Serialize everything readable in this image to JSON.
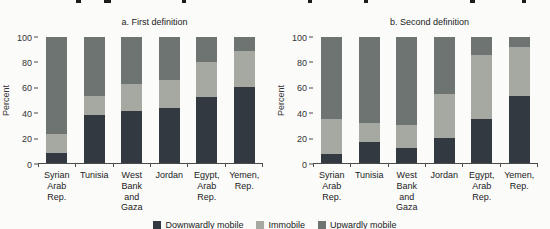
{
  "figure": {
    "background": "#fbfbfa"
  },
  "legend": {
    "items": [
      {
        "label": "Downwardly mobile",
        "color": "#323941"
      },
      {
        "label": "Immobile",
        "color": "#a5a9a2"
      },
      {
        "label": "Upwardly mobile",
        "color": "#6d7472"
      }
    ]
  },
  "chart_data": [
    {
      "type": "bar",
      "stacked": true,
      "title": "a. First definition",
      "ylabel": "Percent",
      "ylim": [
        0,
        100
      ],
      "yticks": [
        0,
        20,
        40,
        60,
        80,
        100
      ],
      "grid": false,
      "legend_position": "bottom-center-shared",
      "categories": [
        "Syrian Arab\nRep.",
        "Tunisia",
        "West Bank\nand Gaza",
        "Jordan",
        "Egypt,\nArab Rep.",
        "Yemen,\nRep."
      ],
      "series": [
        {
          "name": "Downwardly mobile",
          "color": "#323941",
          "values": [
            8,
            38,
            41,
            44,
            52,
            60
          ]
        },
        {
          "name": "Immobile",
          "color": "#a5a9a2",
          "values": [
            15,
            15,
            22,
            22,
            28,
            29
          ]
        },
        {
          "name": "Upwardly mobile",
          "color": "#6d7472",
          "values": [
            77,
            47,
            37,
            34,
            20,
            11
          ]
        }
      ]
    },
    {
      "type": "bar",
      "stacked": true,
      "title": "b. Second definition",
      "ylabel": "Percent",
      "ylim": [
        0,
        100
      ],
      "yticks": [
        0,
        20,
        40,
        60,
        80,
        100
      ],
      "grid": false,
      "legend_position": "bottom-center-shared",
      "categories": [
        "Syrian Arab\nRep.",
        "Tunisia",
        "West Bank\nand Gaza",
        "Jordan",
        "Egypt,\nArab Rep.",
        "Yemen,\nRep."
      ],
      "series": [
        {
          "name": "Downwardly mobile",
          "color": "#323941",
          "values": [
            7,
            17,
            12,
            20,
            35,
            53
          ]
        },
        {
          "name": "Immobile",
          "color": "#a5a9a2",
          "values": [
            28,
            15,
            18,
            35,
            51,
            39
          ]
        },
        {
          "name": "Upwardly mobile",
          "color": "#6d7472",
          "values": [
            65,
            68,
            70,
            45,
            14,
            8
          ]
        }
      ]
    }
  ]
}
